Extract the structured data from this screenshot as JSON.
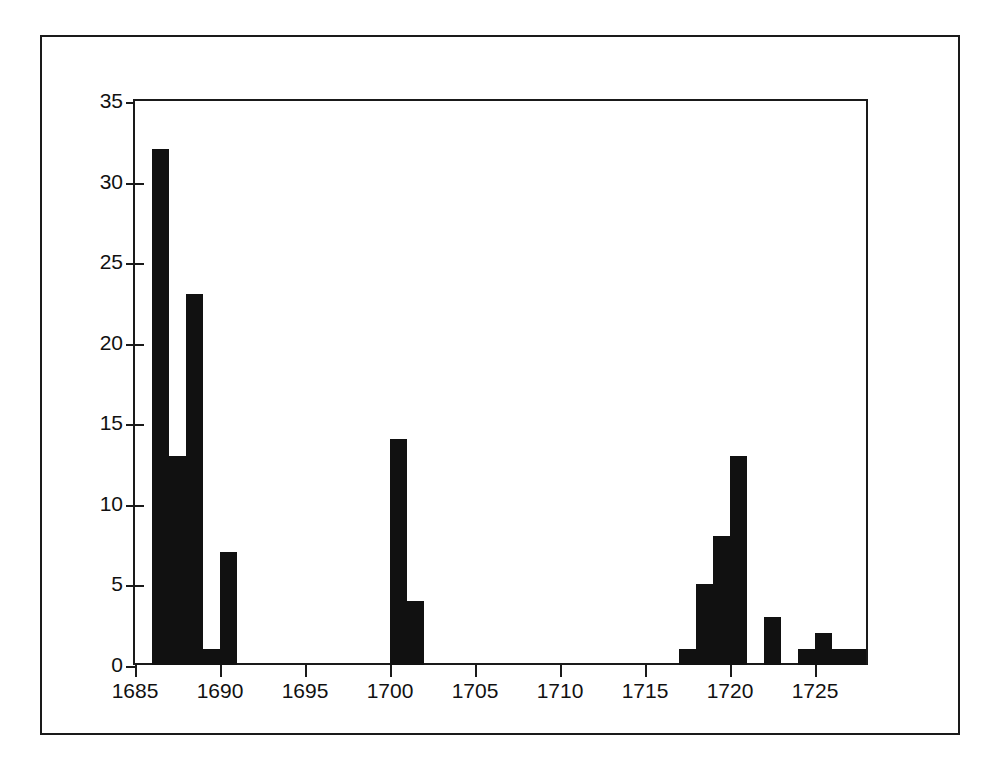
{
  "figure": {
    "background_color": "#ffffff",
    "frame_color": "#1a1a1a",
    "bar_color": "#111111"
  },
  "chart_data": {
    "type": "bar",
    "title": "",
    "subtitle": "",
    "xlabel": "",
    "ylabel": "",
    "xlim": [
      1685,
      1728
    ],
    "ylim": [
      0,
      35
    ],
    "grid": false,
    "legend": null,
    "bar_width_years": 1,
    "x_tick_labels": [
      "1685",
      "1690",
      "1695",
      "1700",
      "1705",
      "1710",
      "1715",
      "1720",
      "1725"
    ],
    "x_ticks": [
      1685,
      1690,
      1695,
      1700,
      1705,
      1710,
      1715,
      1720,
      1725
    ],
    "y_tick_labels": [
      "0",
      "5",
      "10",
      "15",
      "20",
      "25",
      "30",
      "35"
    ],
    "y_ticks": [
      0,
      5,
      10,
      15,
      20,
      25,
      30,
      35
    ],
    "categories": [
      1686,
      1687,
      1688,
      1689,
      1690,
      1700,
      1701,
      1717,
      1718,
      1719,
      1720,
      1722,
      1724,
      1725,
      1726,
      1727
    ],
    "values": [
      32,
      13,
      23,
      1,
      7,
      14,
      4,
      1,
      5,
      8,
      13,
      3,
      1,
      2,
      1,
      1
    ],
    "bars": [
      {
        "x": 1686,
        "value": 32
      },
      {
        "x": 1687,
        "value": 13
      },
      {
        "x": 1688,
        "value": 23
      },
      {
        "x": 1689,
        "value": 1
      },
      {
        "x": 1690,
        "value": 7
      },
      {
        "x": 1700,
        "value": 14
      },
      {
        "x": 1701,
        "value": 4
      },
      {
        "x": 1717,
        "value": 1
      },
      {
        "x": 1718,
        "value": 5
      },
      {
        "x": 1719,
        "value": 8
      },
      {
        "x": 1720,
        "value": 13
      },
      {
        "x": 1722,
        "value": 3
      },
      {
        "x": 1724,
        "value": 1
      },
      {
        "x": 1725,
        "value": 2
      },
      {
        "x": 1726,
        "value": 1
      },
      {
        "x": 1727,
        "value": 1
      }
    ]
  }
}
